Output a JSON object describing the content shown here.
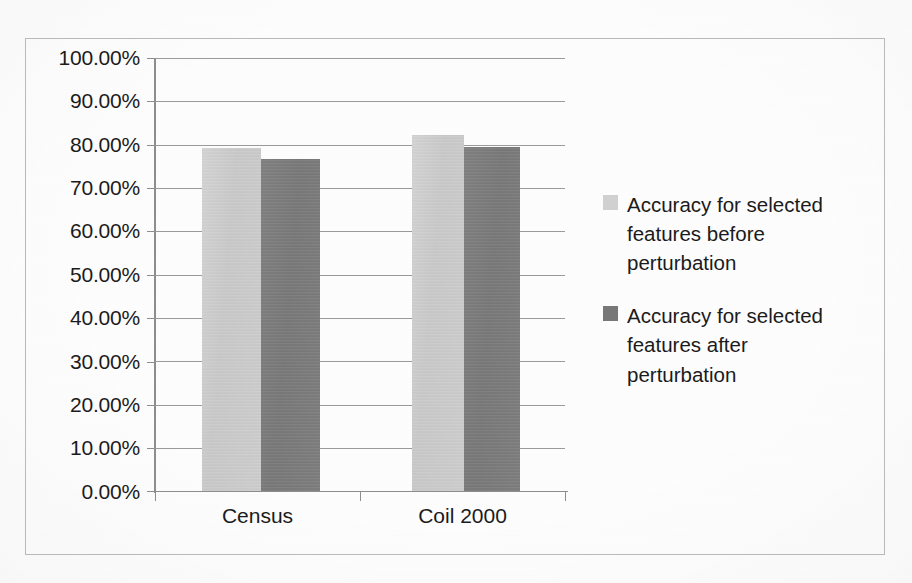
{
  "chart_data": {
    "type": "bar",
    "title": "",
    "subtitle": "",
    "xlabel": "",
    "ylabel": "",
    "categories": [
      "Census",
      "Coil 2000"
    ],
    "series": [
      {
        "name": "Accuracy for selected features before perturbation",
        "color": "#d0d0d0",
        "values": [
          79.3,
          82.2
        ]
      },
      {
        "name": "Accuracy for selected features after perturbation",
        "color": "#787878",
        "values": [
          76.6,
          79.4
        ]
      }
    ],
    "ylim": [
      0,
      100
    ],
    "y_tick_step": 10,
    "y_tick_labels": [
      "100.00%",
      "90.00%",
      "80.00%",
      "70.00%",
      "60.00%",
      "50.00%",
      "40.00%",
      "30.00%",
      "20.00%",
      "10.00%",
      "0.00%"
    ],
    "value_format": "percent",
    "grid": true,
    "grid_axis": "y",
    "legend_position": "right",
    "data_labels": false
  },
  "legend": {
    "entries": [
      {
        "label": "Accuracy for selected features before perturbation",
        "swatch": "#d0d0d0"
      },
      {
        "label": "Accuracy for selected features after perturbation",
        "swatch": "#787878"
      }
    ]
  },
  "axis": {
    "x_categories": [
      "Census",
      "Coil 2000"
    ],
    "y_labels": [
      "100.00%",
      "90.00%",
      "80.00%",
      "70.00%",
      "60.00%",
      "50.00%",
      "40.00%",
      "30.00%",
      "20.00%",
      "10.00%",
      "0.00%"
    ]
  },
  "colors": {
    "series_before": "#d0d0d0",
    "series_after": "#787878",
    "gridline": "#9a9a9a",
    "axis": "#8d8d8d",
    "frame": "#b9b9b9",
    "text": "#1b1b1b",
    "background": "#fdfdfd"
  }
}
